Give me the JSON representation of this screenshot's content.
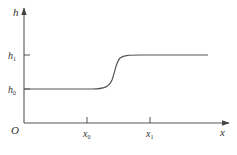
{
  "diagram": {
    "type": "step-transition-curve",
    "colors": {
      "axis": "#444444",
      "curve": "#555555",
      "text": "#333333",
      "background": "#ffffff"
    },
    "axes": {
      "y_label": "h",
      "x_label": "x",
      "origin_label": "O"
    },
    "y_ticks": [
      {
        "base": "h",
        "sub": "1",
        "y": 55
      },
      {
        "base": "h",
        "sub": "0",
        "y": 89
      }
    ],
    "x_ticks": [
      {
        "base": "x",
        "sub": "0",
        "x": 87
      },
      {
        "base": "x",
        "sub": "1",
        "x": 150
      }
    ],
    "curve": {
      "description": "Flat at h0, smooth S-shaped rise between x0 and x1, flat at h1",
      "low_level": "h0",
      "high_level": "h1"
    }
  }
}
